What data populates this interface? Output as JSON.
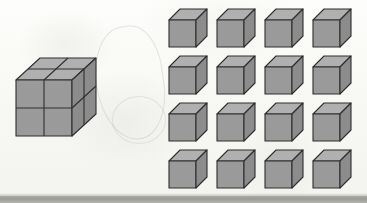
{
  "figure": {
    "background_color": "#fbfbf9",
    "bottom_band_color": "#9e9e99"
  },
  "cube_style": {
    "front_face_color": "#9a9a9a",
    "top_face_color": "#b0b0b0",
    "right_face_color": "#8c8c8c",
    "edge_color": "#2e2e2e",
    "edge_width": "1.1"
  },
  "composite_cube": {
    "name": "composite-cube",
    "label": "2 x 2 x 2 cube",
    "divisions_per_edge": 2,
    "total_unit_cubes": 8,
    "visible_faces": [
      "top",
      "front",
      "right"
    ],
    "squares_per_visible_face": 4,
    "position": {
      "x": 14,
      "y": 52
    },
    "size": {
      "width": 82,
      "height": 84
    }
  },
  "unit_cube_grid": {
    "name": "unit-cube-grid",
    "label": "Array of 16 unit cubes",
    "rows": 4,
    "columns": 4,
    "count": 16,
    "position": {
      "x": 168,
      "y": 8
    },
    "column_spacing": 48,
    "row_spacing": 47,
    "cube_size": {
      "width": 38,
      "height": 38
    },
    "cubes": [
      {
        "row": 1,
        "col": 1,
        "label": "unit cube 1"
      },
      {
        "row": 1,
        "col": 2,
        "label": "unit cube 2"
      },
      {
        "row": 1,
        "col": 3,
        "label": "unit cube 3"
      },
      {
        "row": 1,
        "col": 4,
        "label": "unit cube 4"
      },
      {
        "row": 2,
        "col": 1,
        "label": "unit cube 5"
      },
      {
        "row": 2,
        "col": 2,
        "label": "unit cube 6"
      },
      {
        "row": 2,
        "col": 3,
        "label": "unit cube 7"
      },
      {
        "row": 2,
        "col": 4,
        "label": "unit cube 8"
      },
      {
        "row": 3,
        "col": 1,
        "label": "unit cube 9"
      },
      {
        "row": 3,
        "col": 2,
        "label": "unit cube 10"
      },
      {
        "row": 3,
        "col": 3,
        "label": "unit cube 11"
      },
      {
        "row": 3,
        "col": 4,
        "label": "unit cube 12"
      },
      {
        "row": 4,
        "col": 1,
        "label": "unit cube 13"
      },
      {
        "row": 4,
        "col": 2,
        "label": "unit cube 14"
      },
      {
        "row": 4,
        "col": 3,
        "label": "unit cube 15"
      },
      {
        "row": 4,
        "col": 4,
        "label": "unit cube 16"
      }
    ]
  }
}
